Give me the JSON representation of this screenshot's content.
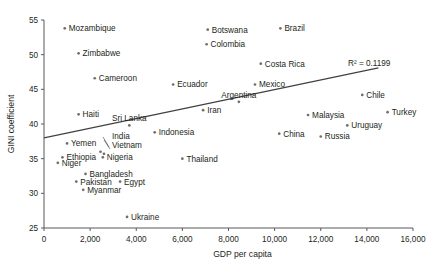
{
  "chart_data": {
    "type": "scatter",
    "title": "",
    "xlabel": "GDP per capita",
    "ylabel": "GINI coefficient",
    "xlim": [
      0,
      16000
    ],
    "ylim": [
      25,
      55
    ],
    "xticks": [
      0,
      2000,
      4000,
      6000,
      8000,
      10000,
      12000,
      14000,
      16000
    ],
    "xticklabels": [
      "0",
      "2,000",
      "4,000",
      "6,000",
      "8,000",
      "10,000",
      "12,000",
      "14,000",
      "16,000"
    ],
    "yticks": [
      25,
      30,
      35,
      40,
      45,
      50,
      55
    ],
    "yticklabels": [
      "25",
      "30",
      "35",
      "40",
      "45",
      "50",
      "55"
    ],
    "grid": false,
    "legend": null,
    "annotations": [
      {
        "text": "R² = 0.1199",
        "x": 14100,
        "y": 48.3
      }
    ],
    "trendline": {
      "type": "linear",
      "x_start": 0,
      "y_start": 38.0,
      "x_end": 14500,
      "y_end": 48.1,
      "r_squared": 0.1199,
      "r_squared_label": "R² = 0.1199"
    },
    "points": [
      {
        "label": "Mozambique",
        "x": 900,
        "y": 53.8,
        "label_pos": "right"
      },
      {
        "label": "Zimbabwe",
        "x": 1500,
        "y": 50.2,
        "label_pos": "right"
      },
      {
        "label": "Cameroon",
        "x": 2200,
        "y": 46.6,
        "label_pos": "right"
      },
      {
        "label": "Haiti",
        "x": 1500,
        "y": 41.4,
        "label_pos": "right"
      },
      {
        "label": "Sri Lanka",
        "x": 3700,
        "y": 39.8,
        "label_pos": "above"
      },
      {
        "label": "Ecuador",
        "x": 5600,
        "y": 45.7,
        "label_pos": "right"
      },
      {
        "label": "Iran",
        "x": 6900,
        "y": 42.0,
        "label_pos": "right"
      },
      {
        "label": "Botswana",
        "x": 7100,
        "y": 53.6,
        "label_pos": "right"
      },
      {
        "label": "Colombia",
        "x": 7050,
        "y": 51.5,
        "label_pos": "right"
      },
      {
        "label": "Brazil",
        "x": 10250,
        "y": 53.8,
        "label_pos": "right"
      },
      {
        "label": "Costa Rica",
        "x": 9400,
        "y": 48.7,
        "label_pos": "right"
      },
      {
        "label": "Mexico",
        "x": 9150,
        "y": 45.7,
        "label_pos": "right"
      },
      {
        "label": "Argentina",
        "x": 8450,
        "y": 43.2,
        "label_pos": "above"
      },
      {
        "label": "Chile",
        "x": 13800,
        "y": 44.2,
        "label_pos": "right"
      },
      {
        "label": "Turkey",
        "x": 14900,
        "y": 41.7,
        "label_pos": "right"
      },
      {
        "label": "Malaysia",
        "x": 11450,
        "y": 41.3,
        "label_pos": "right"
      },
      {
        "label": "Uruguay",
        "x": 13150,
        "y": 39.8,
        "label_pos": "right"
      },
      {
        "label": "Russia",
        "x": 12000,
        "y": 38.2,
        "label_pos": "right"
      },
      {
        "label": "China",
        "x": 10200,
        "y": 38.6,
        "label_pos": "right"
      },
      {
        "label": "Indonesia",
        "x": 4800,
        "y": 38.8,
        "label_pos": "right"
      },
      {
        "label": "Thailand",
        "x": 6000,
        "y": 35.0,
        "label_pos": "right"
      },
      {
        "label": "Yemen",
        "x": 1000,
        "y": 37.2,
        "label_pos": "right"
      },
      {
        "label": "India",
        "x": 2450,
        "y": 36.0,
        "label_pos": "leader"
      },
      {
        "label": "Vietnam",
        "x": 2600,
        "y": 35.7,
        "label_pos": "leader"
      },
      {
        "label": "Ethiopia",
        "x": 800,
        "y": 35.2,
        "label_pos": "right"
      },
      {
        "label": "Nigeria",
        "x": 2550,
        "y": 35.2,
        "label_pos": "right"
      },
      {
        "label": "Niger",
        "x": 600,
        "y": 34.4,
        "label_pos": "right"
      },
      {
        "label": "Bangladesh",
        "x": 1800,
        "y": 32.8,
        "label_pos": "right"
      },
      {
        "label": "Pakistan",
        "x": 1400,
        "y": 31.7,
        "label_pos": "right"
      },
      {
        "label": "Egypt",
        "x": 3300,
        "y": 31.7,
        "label_pos": "right"
      },
      {
        "label": "Myanmar",
        "x": 1700,
        "y": 30.5,
        "label_pos": "right"
      },
      {
        "label": "Ukraine",
        "x": 3600,
        "y": 26.6,
        "label_pos": "right"
      }
    ]
  },
  "colors": {
    "marker": "#6d6e71",
    "axis": "#58595b",
    "trend": "#414042",
    "text": "#231f20",
    "background": "#ffffff"
  }
}
